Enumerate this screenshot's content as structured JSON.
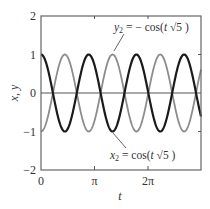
{
  "chart_data": {
    "type": "line",
    "title": "",
    "xlabel": "t",
    "ylabel": "x, y",
    "xlim": [
      0,
      9.42478
    ],
    "ylim": [
      -2,
      2
    ],
    "xticks": [
      {
        "value": 0,
        "label": "0"
      },
      {
        "value": 3.14159,
        "label": "π"
      },
      {
        "value": 6.28319,
        "label": "2π"
      }
    ],
    "yticks": [
      {
        "value": -2,
        "label": "−2"
      },
      {
        "value": -1,
        "label": "−1"
      },
      {
        "value": 0,
        "label": "0"
      },
      {
        "value": 1,
        "label": "1"
      },
      {
        "value": 2,
        "label": "2"
      }
    ],
    "grid": false,
    "zero_line": true,
    "series": [
      {
        "name": "x2 = cos(t√5)",
        "expression": "cos(t*sqrt(5))",
        "color": "#1a1a1a",
        "line_width": 2.2,
        "amplitude": 1,
        "angular_frequency": 2.23607,
        "phase_sign": 1
      },
      {
        "name": "y2 = −cos(t√5)",
        "expression": "-cos(t*sqrt(5))",
        "color": "#8c8c8c",
        "line_width": 1.8,
        "amplitude": 1,
        "angular_frequency": 2.23607,
        "phase_sign": -1
      }
    ],
    "annotations": [
      {
        "text_var": "y",
        "text_sub": "2",
        "text_rest": " = − cos(t √5 )",
        "target_series": 1,
        "position": "top"
      },
      {
        "text_var": "x",
        "text_sub": "2",
        "text_rest": " = cos(t √5 )",
        "target_series": 0,
        "position": "bottom"
      }
    ]
  },
  "labels": {
    "xlabel": "t",
    "ylabel": "x, y",
    "xtick_0": "0",
    "xtick_pi": "π",
    "xtick_2pi": "2π",
    "ytick_2": "2",
    "ytick_1": "1",
    "ytick_0": "0",
    "ytick_m1": "−1",
    "ytick_m2": "−2",
    "anno_top_var": "y",
    "anno_top_sub": "2",
    "anno_top_eq": " = − cos(",
    "anno_top_t": "t",
    "anno_top_root": " √5 )",
    "anno_bot_var": "x",
    "anno_bot_sub": "2",
    "anno_bot_eq": " = cos(",
    "anno_bot_t": "t",
    "anno_bot_root": " √5 )"
  }
}
